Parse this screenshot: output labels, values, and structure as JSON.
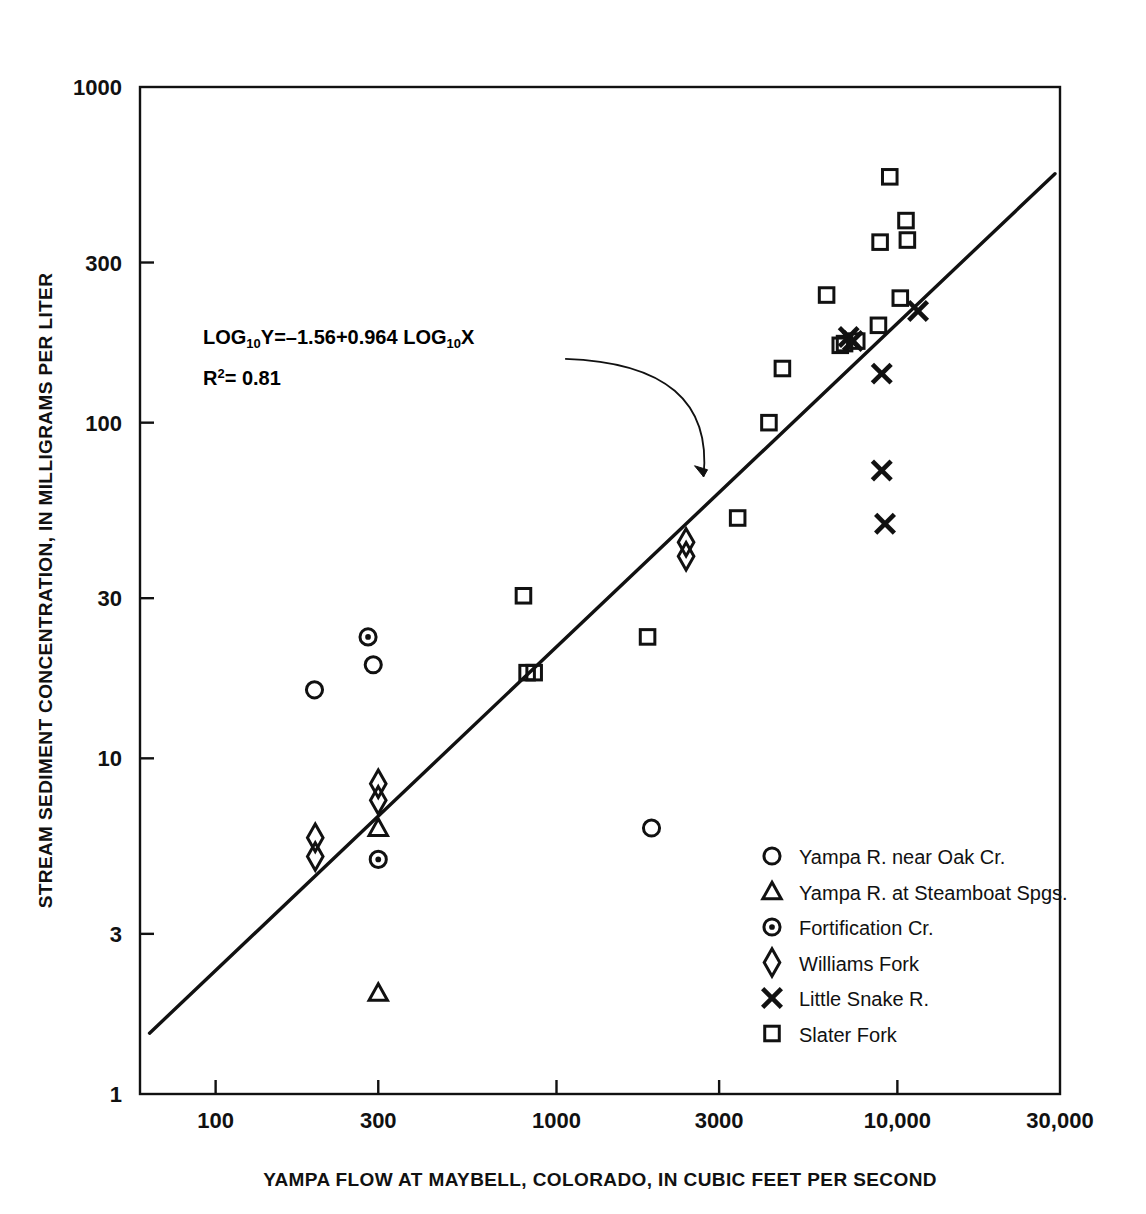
{
  "figure": {
    "xlabel": "YAMPA FLOW AT MAYBELL, COLORADO, IN CUBIC FEET PER SECOND",
    "ylabel": "STREAM SEDIMENT CONCENTRATION, IN MILLIGRAMS PER LITER",
    "equation_line1_a": "LOG",
    "equation_line1_sub1": "10",
    "equation_line1_b": "Y=–1.56+0.964  LOG",
    "equation_line1_sub2": "10",
    "equation_line1_c": "X",
    "equation_line2_a": "R",
    "equation_line2_sup": "2",
    "equation_line2_b": "= 0.81"
  },
  "legend": {
    "items": [
      {
        "marker": "circle",
        "label": "Yampa R. near Oak Cr."
      },
      {
        "marker": "triangle",
        "label": "Yampa R. at  Steamboat Spgs."
      },
      {
        "marker": "circle-dot",
        "label": "Fortification Cr."
      },
      {
        "marker": "diamond",
        "label": "Williams Fork"
      },
      {
        "marker": "x",
        "label": "Little Snake R."
      },
      {
        "marker": "square",
        "label": "Slater  Fork"
      }
    ]
  },
  "chart_data": {
    "type": "scatter",
    "title": "",
    "xlabel": "YAMPA FLOW AT MAYBELL, COLORADO, IN CUBIC FEET PER SECOND",
    "ylabel": "STREAM SEDIMENT CONCENTRATION, IN MILLIGRAMS PER LITER",
    "xscale": "log",
    "yscale": "log",
    "xlim": [
      60,
      30000
    ],
    "ylim": [
      1,
      1000
    ],
    "xticks": [
      100,
      300,
      1000,
      3000,
      10000,
      30000
    ],
    "xticklabels": [
      "100",
      "300",
      "1000",
      "3000",
      "10,000",
      "30,000"
    ],
    "yticks": [
      1,
      3,
      10,
      30,
      100,
      300,
      1000
    ],
    "yticklabels": [
      "1",
      "3",
      "10",
      "30",
      "100",
      "300",
      "1000"
    ],
    "grid": false,
    "legend_position": "lower right",
    "fit": {
      "label": "LOG10Y=-1.56+0.964 LOG10X",
      "intercept": -1.56,
      "slope": 0.964,
      "r_squared": 0.81,
      "x_start": 64,
      "x_end": 29000
    },
    "annotation": {
      "text_line1": "LOG10Y=-1.56+0.964  LOG10X",
      "text_line2": "R2= 0.81",
      "arrow_from_x": 1060,
      "arrow_from_y": 155,
      "arrow_to_x": 2700,
      "arrow_to_y": 69
    },
    "series": [
      {
        "name": "Yampa R. near Oak Cr.",
        "marker": "circle",
        "points": [
          [
            195,
            16
          ],
          [
            290,
            19
          ],
          [
            1900,
            6.2
          ]
        ]
      },
      {
        "name": "Yampa R. at  Steamboat Spgs.",
        "marker": "triangle",
        "points": [
          [
            300,
            6.2
          ],
          [
            300,
            2.0
          ]
        ]
      },
      {
        "name": "Fortification Cr.",
        "marker": "circle-dot",
        "points": [
          [
            280,
            23
          ],
          [
            300,
            5.0
          ]
        ]
      },
      {
        "name": "Williams Fork",
        "marker": "diamond",
        "points": [
          [
            196,
            5.8
          ],
          [
            196,
            5.1
          ],
          [
            300,
            8.4
          ],
          [
            300,
            7.5
          ],
          [
            2400,
            44
          ],
          [
            2400,
            40
          ]
        ]
      },
      {
        "name": "Little Snake R.",
        "marker": "x",
        "points": [
          [
            7200,
            180
          ],
          [
            7400,
            175
          ],
          [
            9000,
            140
          ],
          [
            9000,
            72
          ],
          [
            9200,
            50
          ],
          [
            11500,
            215
          ]
        ]
      },
      {
        "name": "Slater  Fork",
        "marker": "square",
        "points": [
          [
            800,
            30.5
          ],
          [
            820,
            18
          ],
          [
            860,
            18
          ],
          [
            1850,
            23
          ],
          [
            3400,
            52
          ],
          [
            4200,
            100
          ],
          [
            4600,
            145
          ],
          [
            6200,
            240
          ],
          [
            6800,
            170
          ],
          [
            7000,
            172
          ],
          [
            7600,
            175
          ],
          [
            8800,
            195
          ],
          [
            8900,
            345
          ],
          [
            9500,
            540
          ],
          [
            10600,
            400
          ],
          [
            10700,
            350
          ],
          [
            10200,
            235
          ]
        ]
      }
    ]
  }
}
